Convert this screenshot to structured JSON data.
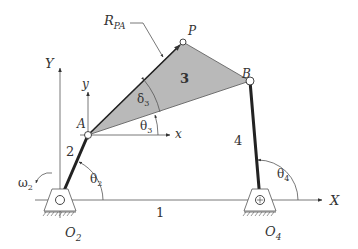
{
  "diagram": {
    "type": "fourbar-linkage",
    "colors": {
      "coupler_fill": "#b9b9b9",
      "link": "#222222",
      "line": "#555555",
      "text": "#333333"
    },
    "labels": {
      "global_x": "X",
      "global_y": "Y",
      "local_x": "x",
      "local_y": "y",
      "point_A": "A",
      "point_B": "B",
      "point_P": "P",
      "pivot_O2": "O",
      "pivot_O2_sub": "2",
      "pivot_O4": "O",
      "pivot_O4_sub": "4",
      "vector_RPA": "R",
      "vector_RPA_sub": "PA",
      "link1": "1",
      "link2": "2",
      "link3": "3",
      "link4": "4",
      "theta2": "θ",
      "theta2_sub": "2",
      "theta3": "θ",
      "theta3_sub": "3",
      "theta4": "θ",
      "theta4_sub": "4",
      "delta3": "δ",
      "delta3_sub": "3",
      "omega2": "ω",
      "omega2_sub": "2"
    }
  }
}
